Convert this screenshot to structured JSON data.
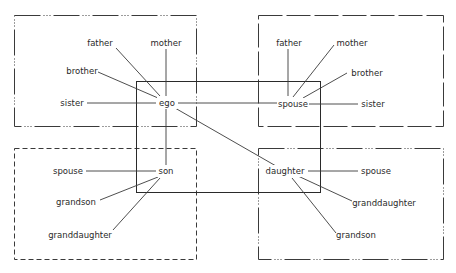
{
  "diagram": {
    "frames": [
      {
        "id": "ego-family-of-orientation",
        "style": "dash-dot"
      },
      {
        "id": "spouse-family-of-orientation",
        "style": "long-dash"
      },
      {
        "id": "ego-family-of-procreation",
        "style": "solid"
      },
      {
        "id": "son-family",
        "style": "short-dash"
      },
      {
        "id": "daughter-family",
        "style": "dash-dot"
      }
    ],
    "nodes": {
      "tl_father": "father",
      "tl_mother": "mother",
      "tl_brother": "brother",
      "tl_sister": "sister",
      "ego": "ego",
      "tr_father": "father",
      "tr_mother": "mother",
      "tr_brother": "brother",
      "tr_sister": "sister",
      "spouse": "spouse",
      "son": "son",
      "bl_spouse": "spouse",
      "bl_grandson": "grandson",
      "bl_granddaughter": "granddaughter",
      "daughter": "daughter",
      "br_spouse": "spouse",
      "br_granddaughter": "granddaughter",
      "br_grandson": "grandson"
    },
    "edges": [
      [
        "ego",
        "tl_father"
      ],
      [
        "ego",
        "tl_mother"
      ],
      [
        "ego",
        "tl_brother"
      ],
      [
        "ego",
        "tl_sister"
      ],
      [
        "ego",
        "spouse"
      ],
      [
        "ego",
        "son"
      ],
      [
        "ego",
        "daughter"
      ],
      [
        "spouse",
        "tr_father"
      ],
      [
        "spouse",
        "tr_mother"
      ],
      [
        "spouse",
        "tr_brother"
      ],
      [
        "spouse",
        "tr_sister"
      ],
      [
        "son",
        "bl_spouse"
      ],
      [
        "son",
        "bl_grandson"
      ],
      [
        "son",
        "bl_granddaughter"
      ],
      [
        "daughter",
        "br_spouse"
      ],
      [
        "daughter",
        "br_granddaughter"
      ],
      [
        "daughter",
        "br_grandson"
      ]
    ]
  }
}
